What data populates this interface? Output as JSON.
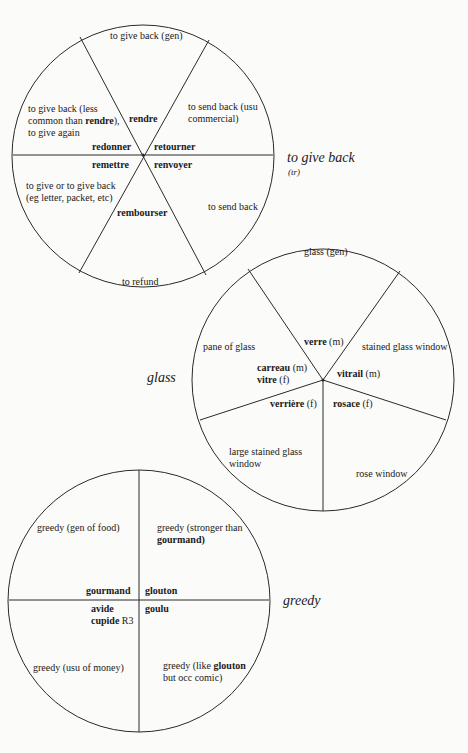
{
  "diagrams": [
    {
      "title": "to give back",
      "subtitle": "(tr)",
      "words": {
        "rendre": "rendre",
        "redonner": "redonner",
        "retourner": "retourner",
        "remettre": "remettre",
        "renvoyer": "renvoyer",
        "rembourser": "rembourser"
      },
      "glosses": {
        "rendre": "to give back (gen)",
        "redonner_1": "to give back (less",
        "redonner_2a": "common than ",
        "redonner_2b": "rendre",
        "redonner_2c": "),",
        "redonner_3": "to give again",
        "retourner_1": "to send back (usu",
        "retourner_2": "commercial)",
        "remettre_1": "to give or to give back",
        "remettre_2": "(eg letter, packet, etc)",
        "renvoyer": "to send back",
        "rembourser": "to refund"
      }
    },
    {
      "title": "glass",
      "words": {
        "verre": "verre",
        "verre_g": "(m)",
        "carreau": "carreau",
        "carreau_g": "(m)",
        "vitre": "vitre",
        "vitre_g": "(f)",
        "vitrail": "vitrail",
        "vitrail_g": "(m)",
        "verriere": "verrière",
        "verriere_g": "(f)",
        "rosace": "rosace",
        "rosace_g": "(f)"
      },
      "glosses": {
        "verre": "glass (gen)",
        "carreau": "pane of glass",
        "vitrail": "stained glass window",
        "verriere_1": "large stained glass",
        "verriere_2": "window",
        "rosace": "rose window"
      }
    },
    {
      "title": "greedy",
      "words": {
        "gourmand": "gourmand",
        "glouton": "glouton",
        "avide": "avide",
        "cupide": "cupide",
        "cupide_reg": "R3",
        "goulu": "goulu"
      },
      "glosses": {
        "gourmand": "greedy (gen of food)",
        "glouton_1": "greedy (stronger than",
        "glouton_2": "gourmand)",
        "avide": "greedy (usu of money)",
        "goulu_1a": "greedy (like ",
        "goulu_1b": "glouton",
        "goulu_2": "but occ comic)"
      }
    }
  ],
  "colors": {
    "line": "#2a2a2a",
    "background": "#fbfbf9",
    "text": "#1a1a1a"
  }
}
